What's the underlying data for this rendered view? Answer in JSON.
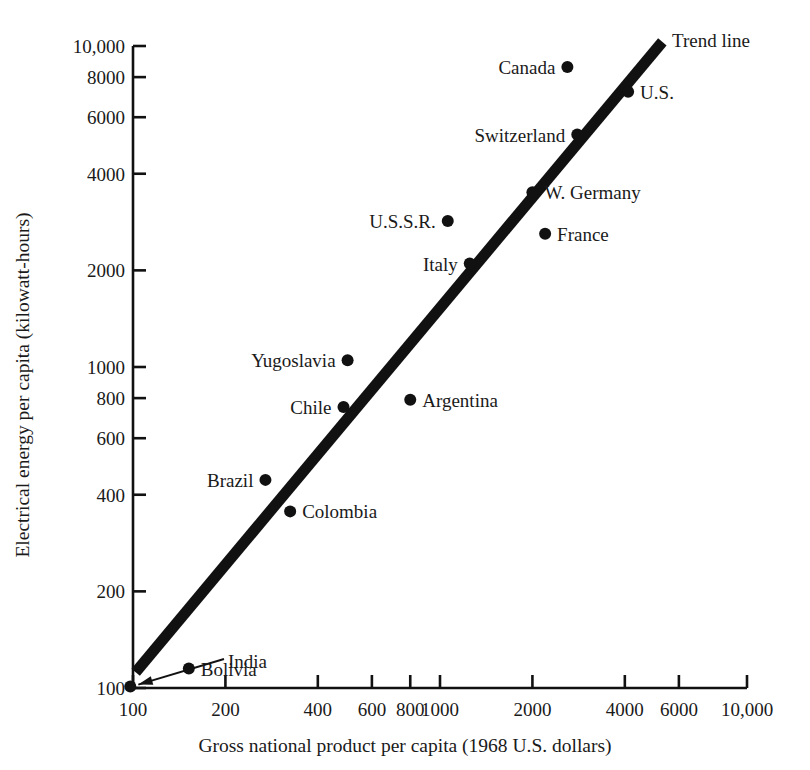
{
  "chart_data": {
    "type": "scatter",
    "title": "",
    "xlabel": "Gross national product per capita (1968 U.S. dollars)",
    "ylabel": "Electrical energy per capita (kilowatt-hours)",
    "xscale": "log",
    "yscale": "log",
    "xlim": [
      90,
      12000
    ],
    "ylim": [
      95,
      11500
    ],
    "grid": false,
    "legend": "none",
    "xticks": [
      {
        "value": 100,
        "label": "100"
      },
      {
        "value": 200,
        "label": "200"
      },
      {
        "value": 400,
        "label": "400"
      },
      {
        "value": 600,
        "label": "600"
      },
      {
        "value": 800,
        "label": "800"
      },
      {
        "value": 1000,
        "label": "1000"
      },
      {
        "value": 2000,
        "label": "2000"
      },
      {
        "value": 4000,
        "label": "4000"
      },
      {
        "value": 6000,
        "label": "6000"
      },
      {
        "value": 10000,
        "label": "10,000"
      }
    ],
    "yticks": [
      {
        "value": 100,
        "label": "100"
      },
      {
        "value": 200,
        "label": "200"
      },
      {
        "value": 400,
        "label": "400"
      },
      {
        "value": 600,
        "label": "600"
      },
      {
        "value": 800,
        "label": "800"
      },
      {
        "value": 1000,
        "label": "1000"
      },
      {
        "value": 2000,
        "label": "2000"
      },
      {
        "value": 4000,
        "label": "4000"
      },
      {
        "value": 6000,
        "label": "6000"
      },
      {
        "value": 8000,
        "label": "8000"
      },
      {
        "value": 10000,
        "label": "10,000"
      }
    ],
    "points": [
      {
        "name": "Canada",
        "x": 2600,
        "y": 8600,
        "label_side": "left"
      },
      {
        "name": "U.S.",
        "x": 4100,
        "y": 7200,
        "label_side": "right"
      },
      {
        "name": "Switzerland",
        "x": 2800,
        "y": 5300,
        "label_side": "left"
      },
      {
        "name": "W. Germany",
        "x": 2000,
        "y": 3500,
        "label_side": "right"
      },
      {
        "name": "U.S.S.R.",
        "x": 1060,
        "y": 2850,
        "label_side": "left"
      },
      {
        "name": "France",
        "x": 2200,
        "y": 2600,
        "label_side": "right"
      },
      {
        "name": "Italy",
        "x": 1250,
        "y": 2100,
        "label_side": "left"
      },
      {
        "name": "Yugoslavia",
        "x": 500,
        "y": 1050,
        "label_side": "left"
      },
      {
        "name": "Argentina",
        "x": 800,
        "y": 790,
        "label_side": "right"
      },
      {
        "name": "Chile",
        "x": 485,
        "y": 750,
        "label_side": "left"
      },
      {
        "name": "Brazil",
        "x": 270,
        "y": 445,
        "label_side": "left"
      },
      {
        "name": "Colombia",
        "x": 325,
        "y": 355,
        "label_side": "right"
      },
      {
        "name": "Bolivia",
        "x": 152,
        "y": 115,
        "label_side": "right"
      },
      {
        "name": "India",
        "x": 98,
        "y": 101,
        "label_side": "leader"
      }
    ],
    "trend_line": {
      "label": "Trend line",
      "start": {
        "x": 102,
        "y": 112
      },
      "end": {
        "x": 5300,
        "y": 10300
      }
    },
    "colors": {
      "ink": "#111111",
      "background": "#ffffff"
    }
  }
}
